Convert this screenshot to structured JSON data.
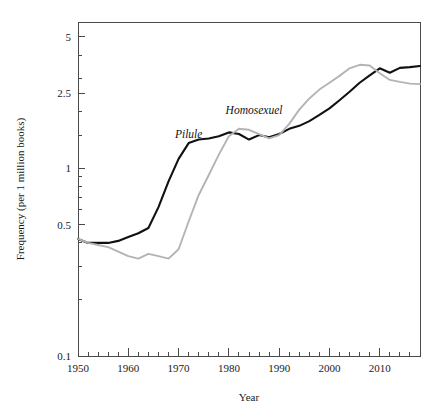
{
  "chart_data": {
    "type": "line",
    "title": "",
    "xlabel": "Year",
    "ylabel": "Frequency (per 1 million books)",
    "yscale": "log",
    "ylim": [
      0.1,
      6.0
    ],
    "xlim": [
      1950,
      2018
    ],
    "grid": false,
    "legend_position": "inline-labels",
    "ytick_labels": [
      "5",
      "2.5",
      "1",
      "0.5",
      "0.1"
    ],
    "ytick_values": [
      5,
      2.5,
      1,
      0.5,
      0.1
    ],
    "xtick_labels": [
      "1950",
      "1960",
      "1970",
      "1980",
      "1990",
      "2000",
      "2010"
    ],
    "xtick_values": [
      1950,
      1960,
      1970,
      1980,
      1990,
      2000,
      2010
    ],
    "x": [
      1950,
      1952,
      1954,
      1956,
      1958,
      1960,
      1962,
      1964,
      1966,
      1968,
      1970,
      1972,
      1974,
      1976,
      1978,
      1980,
      1982,
      1984,
      1986,
      1988,
      1990,
      1992,
      1994,
      1996,
      1998,
      2000,
      2002,
      2004,
      2006,
      2008,
      2010,
      2012,
      2014,
      2016,
      2018
    ],
    "series": [
      {
        "name": "Pilule",
        "color": "#111111",
        "label_x": 1972,
        "label_y": 1.45,
        "values": [
          0.42,
          0.4,
          0.4,
          0.4,
          0.41,
          0.43,
          0.45,
          0.48,
          0.62,
          0.85,
          1.12,
          1.36,
          1.42,
          1.44,
          1.48,
          1.55,
          1.52,
          1.42,
          1.5,
          1.46,
          1.52,
          1.62,
          1.68,
          1.78,
          1.92,
          2.08,
          2.3,
          2.55,
          2.85,
          3.12,
          3.4,
          3.22,
          3.42,
          3.45,
          3.5
        ]
      },
      {
        "name": "Homosexuel",
        "color": "#b4b4b4",
        "label_x": 1985,
        "label_y": 1.95,
        "values": [
          0.42,
          0.4,
          0.39,
          0.38,
          0.36,
          0.34,
          0.33,
          0.35,
          0.34,
          0.33,
          0.37,
          0.52,
          0.72,
          0.92,
          1.18,
          1.48,
          1.62,
          1.6,
          1.52,
          1.44,
          1.5,
          1.72,
          2.05,
          2.35,
          2.62,
          2.85,
          3.1,
          3.4,
          3.55,
          3.52,
          3.2,
          2.95,
          2.88,
          2.82,
          2.8
        ]
      }
    ]
  },
  "axes": {
    "ylabel_text": "Frequency (per 1 million books)",
    "xlabel_text": "Year"
  }
}
